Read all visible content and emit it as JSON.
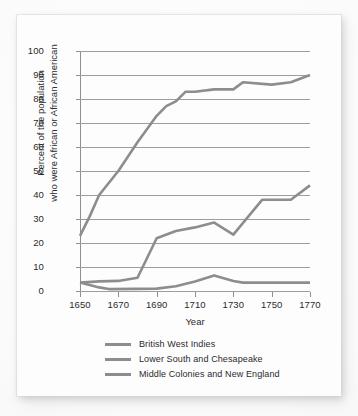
{
  "chart_data": {
    "type": "line",
    "title": "",
    "xlabel": "Year",
    "ylabel_line1": "Percent of the population",
    "ylabel_line2": "who were African or African American",
    "xlim": [
      1650,
      1770
    ],
    "ylim": [
      0,
      100
    ],
    "grid": "horizontal",
    "legend_position": "below",
    "xticks": [
      1650,
      1670,
      1690,
      1710,
      1730,
      1750,
      1770
    ],
    "yticks": [
      0,
      10,
      20,
      30,
      40,
      50,
      60,
      70,
      80,
      90,
      100
    ],
    "line_color": "#8d8d8d",
    "grid_color": "#9d9d9d",
    "series": [
      {
        "name": "British West Indies",
        "color": "#8d8d8d",
        "points": [
          [
            1650,
            23
          ],
          [
            1655,
            31
          ],
          [
            1660,
            40
          ],
          [
            1670,
            50
          ],
          [
            1680,
            62
          ],
          [
            1690,
            73
          ],
          [
            1695,
            77
          ],
          [
            1700,
            79
          ],
          [
            1705,
            83
          ],
          [
            1710,
            83
          ],
          [
            1720,
            84
          ],
          [
            1730,
            84
          ],
          [
            1735,
            87
          ],
          [
            1750,
            86
          ],
          [
            1760,
            87
          ],
          [
            1770,
            90
          ]
        ]
      },
      {
        "name": "Lower South and Chesapeake",
        "color": "#8d8d8d",
        "points": [
          [
            1650,
            3.5
          ],
          [
            1660,
            4
          ],
          [
            1670,
            4.2
          ],
          [
            1680,
            5.5
          ],
          [
            1690,
            22
          ],
          [
            1700,
            25
          ],
          [
            1710,
            26.5
          ],
          [
            1720,
            28.5
          ],
          [
            1730,
            23.5
          ],
          [
            1745,
            38
          ],
          [
            1760,
            38
          ],
          [
            1770,
            44
          ]
        ]
      },
      {
        "name": "Middle Colonies and New England",
        "color": "#8d8d8d",
        "points": [
          [
            1650,
            3.5
          ],
          [
            1660,
            1.5
          ],
          [
            1665,
            0.8
          ],
          [
            1680,
            0.9
          ],
          [
            1690,
            1
          ],
          [
            1700,
            2
          ],
          [
            1710,
            4
          ],
          [
            1720,
            6.5
          ],
          [
            1730,
            4.2
          ],
          [
            1735,
            3.5
          ],
          [
            1750,
            3.5
          ],
          [
            1760,
            3.5
          ],
          [
            1770,
            3.5
          ]
        ]
      }
    ]
  },
  "legend": {
    "items": [
      {
        "label": "British West Indies"
      },
      {
        "label": "Lower South and Chesapeake"
      },
      {
        "label": "Middle Colonies and New England"
      }
    ]
  }
}
